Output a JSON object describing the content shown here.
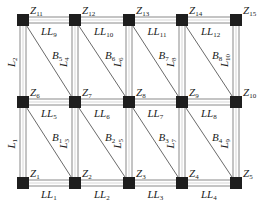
{
  "diagram": {
    "type": "structural-frame",
    "nodes": [
      {
        "id": "Z1",
        "label": "Z",
        "sub": "1",
        "x": 23,
        "y": 183
      },
      {
        "id": "Z2",
        "label": "Z",
        "sub": "2",
        "x": 75,
        "y": 183
      },
      {
        "id": "Z3",
        "label": "Z",
        "sub": "3",
        "x": 129,
        "y": 183
      },
      {
        "id": "Z4",
        "label": "Z",
        "sub": "4",
        "x": 182,
        "y": 183
      },
      {
        "id": "Z5",
        "label": "Z",
        "sub": "5",
        "x": 236,
        "y": 183
      },
      {
        "id": "Z6",
        "label": "Z",
        "sub": "6",
        "x": 23,
        "y": 102
      },
      {
        "id": "Z7",
        "label": "Z",
        "sub": "7",
        "x": 75,
        "y": 102
      },
      {
        "id": "Z8",
        "label": "Z",
        "sub": "8",
        "x": 129,
        "y": 102
      },
      {
        "id": "Z9",
        "label": "Z",
        "sub": "9",
        "x": 182,
        "y": 102
      },
      {
        "id": "Z10",
        "label": "Z",
        "sub": "10",
        "x": 236,
        "y": 102
      },
      {
        "id": "Z11",
        "label": "Z",
        "sub": "11",
        "x": 23,
        "y": 20
      },
      {
        "id": "Z12",
        "label": "Z",
        "sub": "12",
        "x": 75,
        "y": 20
      },
      {
        "id": "Z13",
        "label": "Z",
        "sub": "13",
        "x": 129,
        "y": 20
      },
      {
        "id": "Z14",
        "label": "Z",
        "sub": "14",
        "x": 182,
        "y": 20
      },
      {
        "id": "Z15",
        "label": "Z",
        "sub": "15",
        "x": 236,
        "y": 20
      }
    ],
    "horizontal_beams": [
      {
        "label": "LL",
        "sub": "1",
        "from": "Z1",
        "to": "Z2"
      },
      {
        "label": "LL",
        "sub": "2",
        "from": "Z2",
        "to": "Z3"
      },
      {
        "label": "LL",
        "sub": "3",
        "from": "Z3",
        "to": "Z4"
      },
      {
        "label": "LL",
        "sub": "4",
        "from": "Z4",
        "to": "Z5"
      },
      {
        "label": "LL",
        "sub": "5",
        "from": "Z6",
        "to": "Z7"
      },
      {
        "label": "LL",
        "sub": "6",
        "from": "Z7",
        "to": "Z8"
      },
      {
        "label": "LL",
        "sub": "7",
        "from": "Z8",
        "to": "Z9"
      },
      {
        "label": "LL",
        "sub": "8",
        "from": "Z9",
        "to": "Z10"
      },
      {
        "label": "LL",
        "sub": "9",
        "from": "Z11",
        "to": "Z12"
      },
      {
        "label": "LL",
        "sub": "10",
        "from": "Z12",
        "to": "Z13"
      },
      {
        "label": "LL",
        "sub": "11",
        "from": "Z13",
        "to": "Z14"
      },
      {
        "label": "LL",
        "sub": "12",
        "from": "Z14",
        "to": "Z15"
      }
    ],
    "vertical_members": [
      {
        "label": "L",
        "sub": "1",
        "from": "Z1",
        "to": "Z6"
      },
      {
        "label": "L",
        "sub": "3",
        "from": "Z2",
        "to": "Z7"
      },
      {
        "label": "L",
        "sub": "5",
        "from": "Z3",
        "to": "Z8"
      },
      {
        "label": "L",
        "sub": "7",
        "from": "Z4",
        "to": "Z9"
      },
      {
        "label": "L",
        "sub": "9",
        "from": "Z5",
        "to": "Z10"
      },
      {
        "label": "L",
        "sub": "2",
        "from": "Z6",
        "to": "Z11"
      },
      {
        "label": "L",
        "sub": "4",
        "from": "Z7",
        "to": "Z12"
      },
      {
        "label": "L",
        "sub": "6",
        "from": "Z8",
        "to": "Z13"
      },
      {
        "label": "L",
        "sub": "8",
        "from": "Z9",
        "to": "Z14"
      },
      {
        "label": "L",
        "sub": "10",
        "from": "Z10",
        "to": "Z15"
      }
    ],
    "braces": [
      {
        "label": "B",
        "sub": "1",
        "from": "Z6",
        "to": "Z2"
      },
      {
        "label": "B",
        "sub": "2",
        "from": "Z7",
        "to": "Z3"
      },
      {
        "label": "B",
        "sub": "3",
        "from": "Z8",
        "to": "Z4"
      },
      {
        "label": "B",
        "sub": "4",
        "from": "Z9",
        "to": "Z5"
      },
      {
        "label": "B",
        "sub": "5",
        "from": "Z11",
        "to": "Z7"
      },
      {
        "label": "B",
        "sub": "6",
        "from": "Z12",
        "to": "Z8"
      },
      {
        "label": "B",
        "sub": "7",
        "from": "Z13",
        "to": "Z9"
      },
      {
        "label": "B",
        "sub": "8",
        "from": "Z14",
        "to": "Z10"
      }
    ],
    "colors": {
      "node": "#1e1e1e",
      "member_edge": "#8a8a8a",
      "member_fill": "#ffffff",
      "brace": "#6a6a6a",
      "text": "#222222"
    }
  }
}
